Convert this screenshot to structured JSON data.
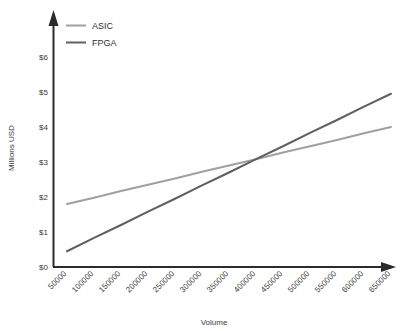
{
  "chart_data": {
    "type": "line",
    "title": "",
    "xlabel": "Volume",
    "ylabel": "Millions USD",
    "x": [
      50000,
      100000,
      150000,
      200000,
      250000,
      300000,
      350000,
      400000,
      450000,
      500000,
      550000,
      600000,
      650000
    ],
    "xticklabels": [
      "50000",
      "100000",
      "150000",
      "200000",
      "250000",
      "300000",
      "350000",
      "400000",
      "450000",
      "500000",
      "550000",
      "600000",
      "650000"
    ],
    "yticklabels": [
      "$0",
      "$1",
      "$2",
      "$3",
      "$4",
      "$5",
      "$6"
    ],
    "yticks": [
      0,
      1,
      2,
      3,
      4,
      5,
      6
    ],
    "ylim": [
      0,
      6.6
    ],
    "xlim": [
      50000,
      650000
    ],
    "grid": false,
    "legend_position": "top-left",
    "series": [
      {
        "name": "ASIC",
        "color": "#a0a0a0",
        "values": [
          1.8,
          1.98,
          2.17,
          2.35,
          2.53,
          2.72,
          2.9,
          3.08,
          3.27,
          3.45,
          3.63,
          3.82,
          4.0
        ]
      },
      {
        "name": "FPGA",
        "color": "#5f5f5f",
        "values": [
          0.45,
          0.83,
          1.2,
          1.58,
          1.95,
          2.33,
          2.7,
          3.08,
          3.45,
          3.83,
          4.2,
          4.58,
          4.95
        ]
      }
    ]
  },
  "axis": {
    "line_color": "#2b2b2b",
    "x_axis_label": "Volume",
    "y_axis_label": "Millions USD"
  },
  "legend": {
    "entries": [
      {
        "label": "ASIC",
        "color": "#a0a0a0"
      },
      {
        "label": "FPGA",
        "color": "#5f5f5f"
      }
    ]
  }
}
